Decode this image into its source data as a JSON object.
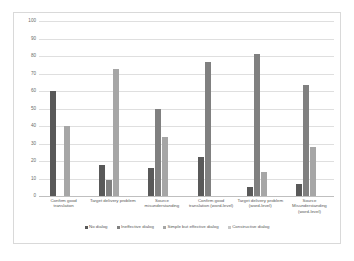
{
  "chart_data": {
    "type": "bar",
    "title": "",
    "subtitle": "",
    "xlabel": "",
    "ylabel": "",
    "ylim": [
      0,
      100
    ],
    "ytick_step": 10,
    "yticks": [
      "100",
      "90",
      "80",
      "70",
      "60",
      "50",
      "40",
      "30",
      "20",
      "10",
      "0"
    ],
    "grid": true,
    "legend_position": "bottom",
    "categories": [
      "Confirm good translation",
      "Target delivery problem",
      "Source misunderstanding",
      "Confirm good translation (word-level)",
      "Target delivery problem (word-level)",
      "Source Misunderstanding (word-level)"
    ],
    "series": [
      {
        "name": "No dialog",
        "color": "#595959",
        "values": [
          60,
          18,
          16,
          22.5,
          5,
          7
        ]
      },
      {
        "name": "Ineffective dialog",
        "color": "#808080",
        "values": [
          null,
          9,
          49.5,
          76.5,
          81,
          63.5
        ]
      },
      {
        "name": "Simple but effective dialog",
        "color": "#a6a6a6",
        "values": [
          40,
          72.5,
          33.5,
          null,
          14,
          28
        ]
      },
      {
        "name": "Constructive dialog",
        "color": "#c8c8c8",
        "values": [
          null,
          null,
          null,
          null,
          null,
          null
        ]
      }
    ]
  },
  "legend": {
    "items": [
      {
        "label": "No dialog",
        "color": "#595959"
      },
      {
        "label": "Ineffective dialog",
        "color": "#808080"
      },
      {
        "label": "Simple but effective dialog",
        "color": "#a6a6a6"
      },
      {
        "label": "Constructive dialog",
        "color": "#c8c8c8"
      }
    ]
  }
}
